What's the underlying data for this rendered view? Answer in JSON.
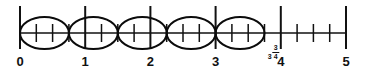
{
  "figure": {
    "type": "number-line",
    "title": ""
  },
  "chart_data": {
    "type": "number-line",
    "title": "",
    "xlabel": "",
    "ylabel": "",
    "xlim": [
      0,
      5
    ],
    "grid": false,
    "legend": null,
    "major_ticks": [
      {
        "value": 0,
        "label": "0"
      },
      {
        "value": 1,
        "label": "1"
      },
      {
        "value": 2,
        "label": "2"
      },
      {
        "value": 3,
        "label": "3"
      },
      {
        "value": 4,
        "label": "4"
      },
      {
        "value": 5,
        "label": "5"
      }
    ],
    "minor_tick_step": 0.25,
    "minor_ticks": [
      0.25,
      0.5,
      0.75,
      1.25,
      1.5,
      1.75,
      2.25,
      2.5,
      2.75,
      3.25,
      3.5,
      3.75,
      4.25,
      4.5,
      4.75
    ],
    "annotations": [
      {
        "value": 3.75,
        "label": "3 3/4",
        "whole": "3",
        "numerator": "3",
        "denominator": "4",
        "position": "above-axis"
      }
    ],
    "groups": [
      {
        "index": 1,
        "start": 0.0,
        "end": 0.75,
        "span": 0.75,
        "shape": "ellipse"
      },
      {
        "index": 2,
        "start": 0.75,
        "end": 1.5,
        "span": 0.75,
        "shape": "ellipse"
      },
      {
        "index": 3,
        "start": 1.5,
        "end": 2.25,
        "span": 0.75,
        "shape": "ellipse"
      },
      {
        "index": 4,
        "start": 2.25,
        "end": 3.0,
        "span": 0.75,
        "shape": "ellipse"
      },
      {
        "index": 5,
        "start": 3.0,
        "end": 3.75,
        "span": 0.75,
        "shape": "ellipse"
      }
    ],
    "group_count": 5
  },
  "colors": {
    "background": "#ffffff",
    "stroke": "#111111",
    "ellipse": "#0b0b0b",
    "label": "#111111"
  }
}
